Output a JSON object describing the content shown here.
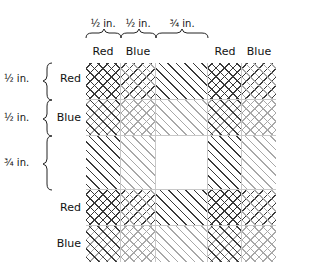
{
  "figure": {
    "top_dimensions": [
      {
        "label": "½ in.",
        "x": 103
      },
      {
        "label": "½ in.",
        "x": 138
      },
      {
        "label": "¾ in.",
        "x": 182
      }
    ],
    "left_dimensions": [
      {
        "label": "½ in.",
        "y": 79
      },
      {
        "label": "½ in.",
        "y": 118
      },
      {
        "label": "¾ in.",
        "y": 163
      }
    ],
    "columns": [
      {
        "label": "Red",
        "color": "red",
        "width": 35
      },
      {
        "label": "Blue",
        "color": "blue",
        "width": 35
      },
      {
        "label": "",
        "color": "none",
        "width": 52
      },
      {
        "label": "Red",
        "color": "red",
        "width": 34
      },
      {
        "label": "Blue",
        "color": "blue",
        "width": 34
      }
    ],
    "rows": [
      {
        "label": "Red",
        "color": "red",
        "height": 37
      },
      {
        "label": "Blue",
        "color": "blue",
        "height": 36
      },
      {
        "label": "",
        "color": "none",
        "height": 54
      },
      {
        "label": "Red",
        "color": "red",
        "height": 36
      },
      {
        "label": "Blue",
        "color": "blue",
        "height": 36
      }
    ],
    "hatch_colors": {
      "red": "#3a3a3a",
      "blue": "#a8a8a8"
    },
    "grid_line_color": "#c8c8c8",
    "border_color": "#222222"
  }
}
